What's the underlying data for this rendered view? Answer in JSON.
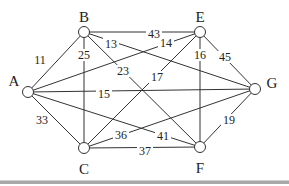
{
  "diagram": {
    "type": "weighted-undirected-graph",
    "nodes": [
      {
        "id": "A",
        "label": "A",
        "x": 28,
        "y": 92,
        "lx": 14,
        "ly": 86
      },
      {
        "id": "B",
        "label": "B",
        "x": 84,
        "y": 32,
        "lx": 84,
        "ly": 22
      },
      {
        "id": "E",
        "label": "E",
        "x": 200,
        "y": 32,
        "lx": 200,
        "ly": 22
      },
      {
        "id": "G",
        "label": "G",
        "x": 255,
        "y": 89,
        "lx": 272,
        "ly": 88
      },
      {
        "id": "C",
        "label": "C",
        "x": 84,
        "y": 148,
        "lx": 84,
        "ly": 174
      },
      {
        "id": "F",
        "label": "F",
        "x": 200,
        "y": 147,
        "lx": 200,
        "ly": 173
      }
    ],
    "edges": [
      {
        "from": "A",
        "to": "B",
        "weight": "11",
        "lx": 40,
        "ly": 62
      },
      {
        "from": "A",
        "to": "C",
        "weight": "33",
        "lx": 42,
        "ly": 122
      },
      {
        "from": "A",
        "to": "G",
        "weight": "15",
        "lx": 104,
        "ly": 96
      },
      {
        "from": "A",
        "to": "E",
        "weight": "14",
        "lx": 166,
        "ly": 45
      },
      {
        "from": "A",
        "to": "F",
        "weight": "41",
        "lx": 163,
        "ly": 138
      },
      {
        "from": "B",
        "to": "E",
        "weight": "43",
        "lx": 154,
        "ly": 36
      },
      {
        "from": "B",
        "to": "C",
        "weight": "25",
        "lx": 84,
        "ly": 57
      },
      {
        "from": "B",
        "to": "G",
        "weight": "13",
        "lx": 111,
        "ly": 46
      },
      {
        "from": "B",
        "to": "F",
        "weight": "23",
        "lx": 123,
        "ly": 73
      },
      {
        "from": "E",
        "to": "C",
        "weight": "17",
        "lx": 157,
        "ly": 79
      },
      {
        "from": "E",
        "to": "F",
        "weight": "16",
        "lx": 200,
        "ly": 57
      },
      {
        "from": "E",
        "to": "G",
        "weight": "45",
        "lx": 225,
        "ly": 59
      },
      {
        "from": "C",
        "to": "G",
        "weight": "36",
        "lx": 121,
        "ly": 137
      },
      {
        "from": "C",
        "to": "F",
        "weight": "37",
        "lx": 145,
        "ly": 153
      },
      {
        "from": "F",
        "to": "G",
        "weight": "19",
        "lx": 229,
        "ly": 122
      }
    ]
  },
  "style": {
    "edge_color": "#333333",
    "node_fill": "#ffffff",
    "node_stroke": "#333333",
    "label_color": "#222222",
    "divider_color": "#a8a8a8"
  }
}
